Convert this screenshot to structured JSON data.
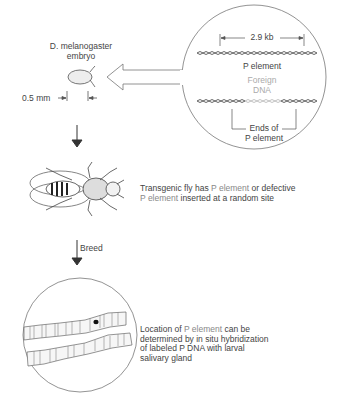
{
  "embryo": {
    "title_line1": "D. melanogaster",
    "title_line2": "embryo",
    "scale": "0.5 mm"
  },
  "plasmid_inset": {
    "length": "2.9 kb",
    "top_label": "P element",
    "foreign_line1": "Foreign",
    "foreign_line2": "DNA",
    "ends_line1": "Ends of",
    "ends_line2": "P element",
    "foreign_color": "#b0b0b0"
  },
  "fly": {
    "caption_line1_a": "Transgenic fly has ",
    "caption_line1_b": "P element",
    "caption_line1_c": " or defective",
    "caption_line2_a": "P element",
    "caption_line2_b": " inserted at a random site"
  },
  "breed_label": "Breed",
  "chromosome": {
    "caption_line1_a": "Location of ",
    "caption_line1_b": "P element",
    "caption_line1_c": " can be",
    "caption_line2": "determined by in situ hybridization",
    "caption_line3": "of labeled P DNA with larval",
    "caption_line4": "salivary gland"
  }
}
